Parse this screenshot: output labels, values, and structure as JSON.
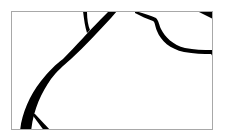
{
  "image": {
    "description": "Cropped fragment of black line-art drawing inside a thin gray frame",
    "frame": {
      "x": 11,
      "y": 11,
      "width": 202,
      "height": 119,
      "border_color": "#a8a8a8",
      "background": "#ffffff"
    },
    "stroke_color": "#000000",
    "shapes": [
      "thick-curved-stroke",
      "thin-branch-stroke",
      "bottom-left-diagonal-stroke",
      "upper-right-curved-outline",
      "top-right-corner-wedge"
    ]
  }
}
